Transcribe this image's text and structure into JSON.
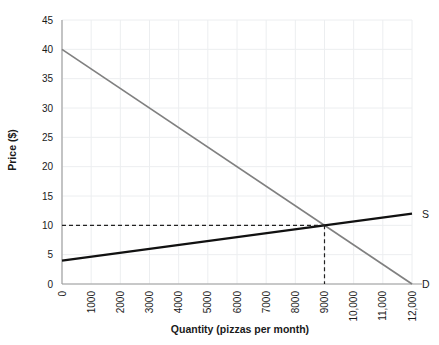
{
  "chart_data": {
    "type": "line",
    "title": "",
    "xlabel": "Quantity (pizzas per month)",
    "ylabel": "Price ($)",
    "xlim": [
      0,
      12000
    ],
    "ylim": [
      0,
      45
    ],
    "grid": true,
    "legend_position": "inline-right",
    "x_ticks": [
      0,
      1000,
      2000,
      3000,
      4000,
      5000,
      6000,
      7000,
      8000,
      9000,
      10000,
      11000,
      12000
    ],
    "x_tick_labels": [
      "0",
      "1000",
      "2000",
      "3000",
      "4000",
      "5000",
      "6000",
      "7000",
      "8000",
      "9000",
      "10,000",
      "11,000",
      "12,000"
    ],
    "y_ticks": [
      0,
      5,
      10,
      15,
      20,
      25,
      30,
      35,
      40,
      45
    ],
    "y_tick_labels": [
      "0",
      "5",
      "10",
      "15",
      "20",
      "25",
      "30",
      "35",
      "40",
      "45"
    ],
    "series": [
      {
        "name": "D",
        "label": "D",
        "color": "#808080",
        "points": [
          [
            0,
            40
          ],
          [
            12000,
            0
          ]
        ]
      },
      {
        "name": "S",
        "label": "S",
        "color": "#111111",
        "points": [
          [
            0,
            4
          ],
          [
            12000,
            12
          ]
        ]
      }
    ],
    "annotations": [
      {
        "name": "equilibrium",
        "x": 9000,
        "y": 10,
        "guides": [
          "horizontal-to-axis",
          "vertical-to-axis"
        ]
      }
    ]
  },
  "labels": {
    "axis_x_title": "Quantity (pizzas per month)",
    "axis_y_title": "Price ($)",
    "demand_curve": "D",
    "supply_curve": "S"
  }
}
